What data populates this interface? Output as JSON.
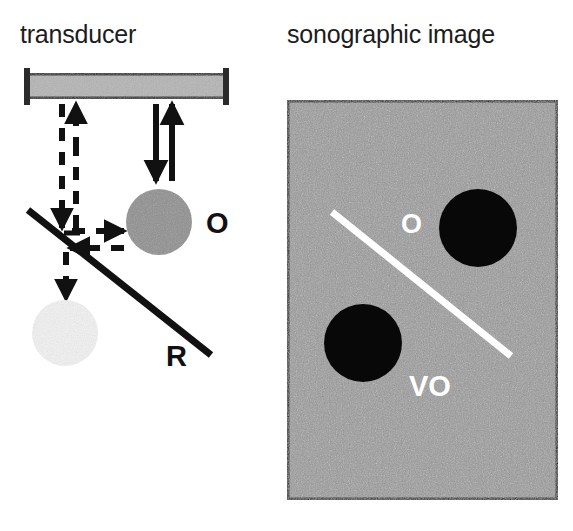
{
  "figure": {
    "kind": "ultrasound-mirror-artifact-diagram",
    "background_color": "#ffffff"
  },
  "panels": {
    "left": {
      "title": "transducer",
      "transducer": {
        "name": "transducer-probe",
        "x": 24,
        "y": 73,
        "width": 205,
        "height": 26,
        "fill_color": "#b4b4b4",
        "stroke_color": "#2b2b2b"
      },
      "object": {
        "label": "O",
        "meaning": "object",
        "cx": 159,
        "cy": 222,
        "r": 33,
        "fill_color": "#8f8f8f",
        "label_x": 206,
        "label_y": 222
      },
      "virtual_object": {
        "label": "",
        "meaning": "virtual object",
        "cx": 65,
        "cy": 333,
        "r": 33,
        "fill_color": "#f2f2f2"
      },
      "reflector": {
        "label": "R",
        "meaning": "reflector",
        "x1": 28,
        "y1": 210,
        "x2": 211,
        "y2": 355,
        "stroke_color": "#111111",
        "stroke_width": 7,
        "label_x": 172,
        "label_y": 355
      },
      "direct_beam": {
        "name": "direct-beam-path",
        "style": "solid",
        "down_x": 156,
        "up_x": 172,
        "top_y": 104,
        "bottom_y": 181,
        "stroke_color": "#111111"
      },
      "mirror_beam": {
        "name": "mirror-beam-path",
        "style": "dashed",
        "stroke_color": "#111111",
        "segments": [
          {
            "name": "transducer-to-reflector-down",
            "x1": 62,
            "y1": 104,
            "x2": 62,
            "y2": 226
          },
          {
            "name": "reflector-to-object-right",
            "x1": 66,
            "y1": 230,
            "x2": 122,
            "y2": 230
          },
          {
            "name": "object-to-reflector-left",
            "x1": 122,
            "y1": 246,
            "x2": 66,
            "y2": 246
          },
          {
            "name": "reflector-to-transducer-up",
            "x1": 74,
            "y1": 226,
            "x2": 74,
            "y2": 104
          },
          {
            "name": "reflector-to-virtual-object-down",
            "x1": 66,
            "y1": 252,
            "x2": 66,
            "y2": 297
          }
        ]
      }
    },
    "right": {
      "title": "sonographic image",
      "frame": {
        "name": "sonographic-image-frame",
        "x": 287,
        "y": 100,
        "width": 271,
        "height": 400,
        "background_color": "#9a9a9a",
        "border_color": "#1a1a1a",
        "border_width": 5,
        "speckle": true
      },
      "object_spot": {
        "label": "O",
        "meaning": "object",
        "cx": 478,
        "cy": 228,
        "r": 39,
        "fill_color": "#080808",
        "label_x": 410,
        "label_y": 222,
        "label_color": "#ffffff"
      },
      "virtual_object_spot": {
        "label": "VO",
        "meaning": "virtual object",
        "cx": 363,
        "cy": 343,
        "r": 39,
        "fill_color": "#080808",
        "label_x": 430,
        "label_y": 385,
        "label_color": "#ffffff"
      },
      "reflector_line": {
        "name": "reflector-line",
        "x1": 332,
        "y1": 212,
        "x2": 511,
        "y2": 356,
        "stroke_color": "#ffffff",
        "stroke_width": 7
      }
    }
  }
}
